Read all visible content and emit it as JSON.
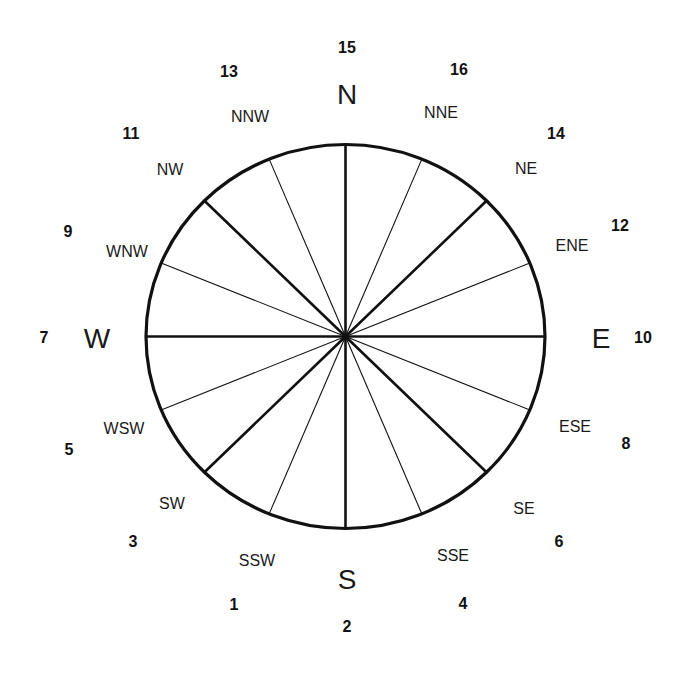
{
  "diagram": {
    "type": "compass-rose",
    "center": {
      "x": 345.5,
      "y": 336.5
    },
    "radius": {
      "rx": 199.5,
      "ry": 192
    },
    "stroke_color": "#111111",
    "cardinals": [
      {
        "id": "N",
        "label": "N",
        "x": 347,
        "y": 95
      },
      {
        "id": "E",
        "label": "E",
        "x": 601,
        "y": 339
      },
      {
        "id": "S",
        "label": "S",
        "x": 347,
        "y": 580
      },
      {
        "id": "W",
        "label": "W",
        "x": 97,
        "y": 339
      }
    ],
    "intercardinals": [
      {
        "id": "NNE",
        "label": "NNE",
        "x": 441,
        "y": 113
      },
      {
        "id": "NE",
        "label": "NE",
        "x": 526,
        "y": 169
      },
      {
        "id": "ENE",
        "label": "ENE",
        "x": 572,
        "y": 246
      },
      {
        "id": "ESE",
        "label": "ESE",
        "x": 575,
        "y": 427
      },
      {
        "id": "SE",
        "label": "SE",
        "x": 524,
        "y": 509
      },
      {
        "id": "SSE",
        "label": "SSE",
        "x": 453,
        "y": 556
      },
      {
        "id": "SSW",
        "label": "SSW",
        "x": 257,
        "y": 561
      },
      {
        "id": "SW",
        "label": "SW",
        "x": 172,
        "y": 504
      },
      {
        "id": "WSW",
        "label": "WSW",
        "x": 124,
        "y": 429
      },
      {
        "id": "WNW",
        "label": "WNW",
        "x": 127,
        "y": 252
      },
      {
        "id": "NW",
        "label": "NW",
        "x": 170,
        "y": 170
      },
      {
        "id": "NNW",
        "label": "NNW",
        "x": 250,
        "y": 117
      }
    ],
    "numbers": [
      {
        "value": "15",
        "x": 347,
        "y": 48
      },
      {
        "value": "16",
        "x": 459,
        "y": 70
      },
      {
        "value": "14",
        "x": 556,
        "y": 134
      },
      {
        "value": "12",
        "x": 620,
        "y": 226
      },
      {
        "value": "10",
        "x": 643,
        "y": 338
      },
      {
        "value": "8",
        "x": 626,
        "y": 444
      },
      {
        "value": "6",
        "x": 559,
        "y": 542
      },
      {
        "value": "4",
        "x": 463,
        "y": 604
      },
      {
        "value": "2",
        "x": 347,
        "y": 627
      },
      {
        "value": "1",
        "x": 234,
        "y": 605
      },
      {
        "value": "3",
        "x": 133,
        "y": 542
      },
      {
        "value": "5",
        "x": 69,
        "y": 450
      },
      {
        "value": "7",
        "x": 44,
        "y": 338
      },
      {
        "value": "9",
        "x": 68,
        "y": 232
      },
      {
        "value": "11",
        "x": 131,
        "y": 134
      },
      {
        "value": "13",
        "x": 229,
        "y": 72
      }
    ]
  }
}
